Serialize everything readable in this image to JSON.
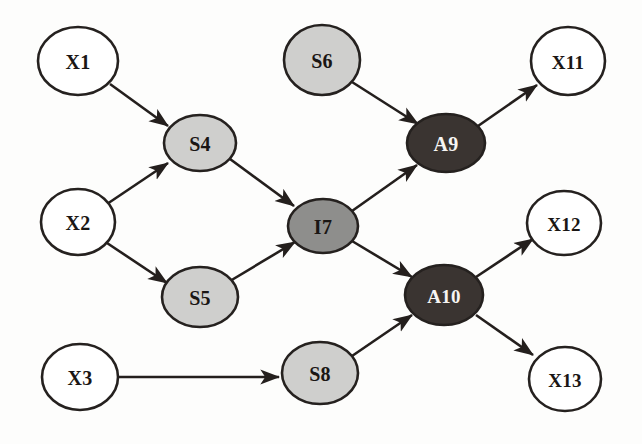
{
  "diagram": {
    "background_color": "#fdfdfc",
    "edge_color": "#241f1d",
    "node_border_color": "#25211f",
    "palette": {
      "white_fill": "#ffffff",
      "light_gray_fill": "#cfcfcd",
      "medium_gray_fill": "#8e8e8c",
      "dark_fill": "#3a3431",
      "dark_text": "#1a1614",
      "light_text": "#f6f5f3"
    },
    "nodes": [
      {
        "id": "X1",
        "label": "X1",
        "cx": 78,
        "cy": 61,
        "rx": 40,
        "ry": 34,
        "fill": "#ffffff",
        "text_color": "#1a1614",
        "kind": "input"
      },
      {
        "id": "X2",
        "label": "X2",
        "cx": 78,
        "cy": 222,
        "rx": 37,
        "ry": 33,
        "fill": "#ffffff",
        "text_color": "#1a1614",
        "kind": "input"
      },
      {
        "id": "X3",
        "label": "X3",
        "cx": 80,
        "cy": 377,
        "rx": 38,
        "ry": 33,
        "fill": "#ffffff",
        "text_color": "#1a1614",
        "kind": "input"
      },
      {
        "id": "S4",
        "label": "S4",
        "cx": 200,
        "cy": 143,
        "rx": 36,
        "ry": 28,
        "fill": "#cfcfcd",
        "text_color": "#1a1614",
        "kind": "sensor"
      },
      {
        "id": "S5",
        "label": "S5",
        "cx": 200,
        "cy": 297,
        "rx": 38,
        "ry": 30,
        "fill": "#cfcfcd",
        "text_color": "#1a1614",
        "kind": "sensor"
      },
      {
        "id": "S6",
        "label": "S6",
        "cx": 322,
        "cy": 60,
        "rx": 38,
        "ry": 35,
        "fill": "#cfcfcd",
        "text_color": "#1a1614",
        "kind": "sensor"
      },
      {
        "id": "S8",
        "label": "S8",
        "cx": 320,
        "cy": 373,
        "rx": 38,
        "ry": 31,
        "fill": "#cfcfcd",
        "text_color": "#1a1614",
        "kind": "sensor"
      },
      {
        "id": "I7",
        "label": "I7",
        "cx": 323,
        "cy": 226,
        "rx": 35,
        "ry": 27,
        "fill": "#8e8e8c",
        "text_color": "#1a1614",
        "kind": "integrator"
      },
      {
        "id": "A9",
        "label": "A9",
        "cx": 446,
        "cy": 143,
        "rx": 39,
        "ry": 29,
        "fill": "#3a3431",
        "text_color": "#f6f5f3",
        "kind": "actuator"
      },
      {
        "id": "A10",
        "label": "A10",
        "cx": 444,
        "cy": 295,
        "rx": 39,
        "ry": 30,
        "fill": "#3a3431",
        "text_color": "#f6f5f3",
        "kind": "actuator"
      },
      {
        "id": "X11",
        "label": "X11",
        "cx": 568,
        "cy": 61,
        "rx": 37,
        "ry": 34,
        "fill": "#ffffff",
        "text_color": "#1a1614",
        "kind": "output"
      },
      {
        "id": "X12",
        "label": "X12",
        "cx": 564,
        "cy": 223,
        "rx": 37,
        "ry": 32,
        "fill": "#ffffff",
        "text_color": "#1a1614",
        "kind": "output"
      },
      {
        "id": "X13",
        "label": "X13",
        "cx": 565,
        "cy": 379,
        "rx": 36,
        "ry": 32,
        "fill": "#ffffff",
        "text_color": "#1a1614",
        "kind": "output"
      }
    ],
    "edges": [
      {
        "from": "X1",
        "to": "S4",
        "x1": 110,
        "y1": 84,
        "x2": 168,
        "y2": 126
      },
      {
        "from": "X2",
        "to": "S4",
        "x1": 107,
        "y1": 204,
        "x2": 168,
        "y2": 163
      },
      {
        "from": "X2",
        "to": "S5",
        "x1": 107,
        "y1": 243,
        "x2": 167,
        "y2": 283
      },
      {
        "from": "S4",
        "to": "I7",
        "x1": 230,
        "y1": 159,
        "x2": 294,
        "y2": 206
      },
      {
        "from": "S5",
        "to": "I7",
        "x1": 230,
        "y1": 281,
        "x2": 295,
        "y2": 242
      },
      {
        "from": "S6",
        "to": "A9",
        "x1": 352,
        "y1": 82,
        "x2": 418,
        "y2": 124
      },
      {
        "from": "I7",
        "to": "A9",
        "x1": 352,
        "y1": 211,
        "x2": 417,
        "y2": 165
      },
      {
        "from": "I7",
        "to": "A10",
        "x1": 352,
        "y1": 241,
        "x2": 412,
        "y2": 277
      },
      {
        "from": "X3",
        "to": "S8",
        "x1": 119,
        "y1": 377,
        "x2": 279,
        "y2": 377
      },
      {
        "from": "S8",
        "to": "A10",
        "x1": 352,
        "y1": 356,
        "x2": 412,
        "y2": 315
      },
      {
        "from": "A9",
        "to": "X11",
        "x1": 478,
        "y1": 126,
        "x2": 537,
        "y2": 85
      },
      {
        "from": "A10",
        "to": "X12",
        "x1": 476,
        "y1": 277,
        "x2": 533,
        "y2": 239
      },
      {
        "from": "A10",
        "to": "X13",
        "x1": 476,
        "y1": 315,
        "x2": 533,
        "y2": 355
      }
    ]
  }
}
